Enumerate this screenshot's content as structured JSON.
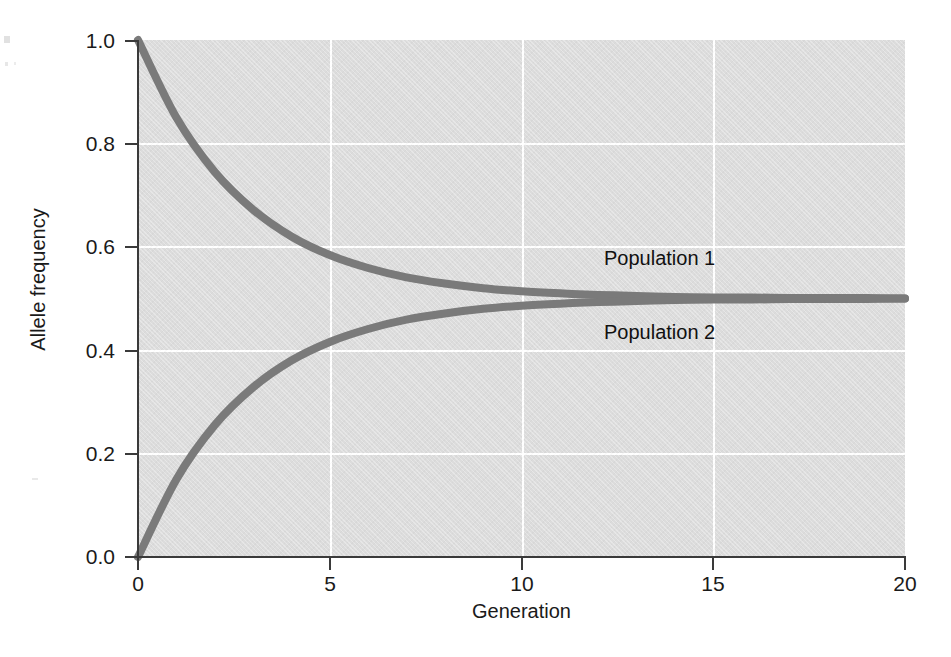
{
  "chart_data": {
    "type": "line",
    "title": "",
    "xlabel": "Generation",
    "ylabel": "Allele frequency",
    "xlim": [
      0,
      20
    ],
    "ylim": [
      0.0,
      1.0
    ],
    "xticks": [
      "0",
      "5",
      "10",
      "15",
      "20"
    ],
    "xtick_values": [
      0,
      5,
      10,
      15,
      20
    ],
    "yticks": [
      "0.0",
      "0.2",
      "0.4",
      "0.6",
      "0.8",
      "1.0"
    ],
    "ytick_values": [
      0.0,
      0.2,
      0.4,
      0.6,
      0.8,
      1.0
    ],
    "grid": true,
    "grid_color": "#ffffff",
    "panel_color": "#dcdcdc",
    "line_color": "#7a7a7a",
    "legend_position": "inline-right",
    "x": [
      0,
      1,
      2,
      3,
      4,
      5,
      6,
      7,
      8,
      9,
      10,
      11,
      12,
      13,
      14,
      15,
      16,
      17,
      18,
      19,
      20
    ],
    "series": [
      {
        "name": "Population 1",
        "label": "Population 1",
        "color": "#7a7a7a",
        "values": [
          1.0,
          0.85,
          0.745,
          0.672,
          0.62,
          0.584,
          0.559,
          0.541,
          0.529,
          0.52,
          0.514,
          0.51,
          0.507,
          0.505,
          0.503,
          0.502,
          0.502,
          0.501,
          0.501,
          0.501,
          0.5
        ]
      },
      {
        "name": "Population 2",
        "label": "Population 2",
        "color": "#7a7a7a",
        "values": [
          0.0,
          0.15,
          0.255,
          0.328,
          0.38,
          0.416,
          0.441,
          0.459,
          0.471,
          0.48,
          0.486,
          0.49,
          0.493,
          0.495,
          0.497,
          0.498,
          0.498,
          0.499,
          0.499,
          0.499,
          0.5
        ]
      }
    ],
    "annotations": [
      {
        "text": "Population 1",
        "x": 14.0,
        "y": 0.575
      },
      {
        "text": "Population 2",
        "x": 14.0,
        "y": 0.425
      }
    ]
  }
}
